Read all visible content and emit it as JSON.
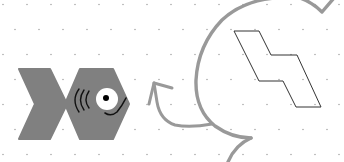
{
  "canvas": {
    "width": 344,
    "height": 162,
    "background": "#ffffff",
    "grid": {
      "type": "staggered-dots",
      "spacing_x": 25,
      "spacing_y": 25,
      "dot_color": "#b0b0b0"
    }
  },
  "shapes": {
    "fish": {
      "fill": "#808080",
      "tail": "hexagon-chevron",
      "head": "hexagon",
      "eye_fill": "#ffffff",
      "pupil_fill": "#000000",
      "gill_count": 3,
      "mouth": "smile-curve"
    },
    "z_outline": {
      "stroke": "#333333",
      "fill": "none"
    },
    "big_arc_arrow": {
      "stroke": "#999999"
    },
    "small_arrow": {
      "stroke": "#999999",
      "direction": "up-left"
    }
  }
}
